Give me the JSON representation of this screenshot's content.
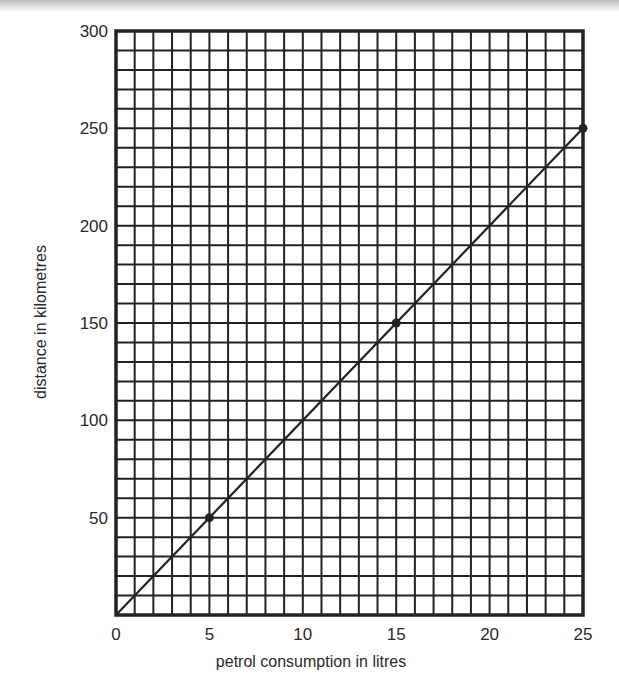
{
  "chart_data": {
    "type": "line",
    "title": "",
    "xlabel": "petrol consumption in litres",
    "ylabel": "distance in kilometres",
    "xlim": [
      0,
      25
    ],
    "ylim": [
      0,
      300
    ],
    "x_ticks": [
      0,
      5,
      10,
      15,
      20,
      25
    ],
    "y_ticks": [
      50,
      100,
      150,
      200,
      250,
      300
    ],
    "x_tick_labels": [
      "0",
      "5",
      "10",
      "15",
      "20",
      "25"
    ],
    "y_tick_labels": [
      "50",
      "100",
      "150",
      "200",
      "250",
      "300"
    ],
    "grid": true,
    "grid_minor_x_step": 1,
    "grid_minor_y_step": 10,
    "legend": null,
    "series": [
      {
        "name": "distance vs petrol",
        "line": {
          "x": [
            0,
            25
          ],
          "y": [
            0,
            250
          ]
        },
        "markers": {
          "x": [
            5,
            15,
            25
          ],
          "y": [
            50,
            150,
            250
          ]
        }
      }
    ]
  },
  "colors": {
    "ink": "#222222",
    "background": "#ffffff"
  }
}
